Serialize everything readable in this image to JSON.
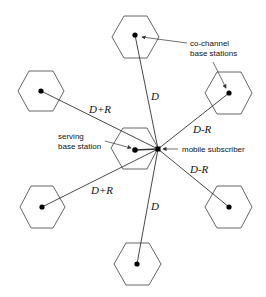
{
  "diagram": {
    "labels": {
      "co_channel_line1": "co-channel",
      "co_channel_line2": "base stations",
      "serving_line1": "serving",
      "serving_line2": "base station",
      "mobile": "mobile  subscriber"
    },
    "distances": {
      "top": "D",
      "upper_left": "D+R",
      "upper_right": "D-R",
      "lower_right": "D-R",
      "lower_left": "D+R",
      "bottom": "D"
    },
    "cells": [
      {
        "id": "top",
        "role": "co-channel base station"
      },
      {
        "id": "upper-left",
        "role": "co-channel base station"
      },
      {
        "id": "upper-right",
        "role": "co-channel base station"
      },
      {
        "id": "lower-left",
        "role": "co-channel base station"
      },
      {
        "id": "lower-right",
        "role": "co-channel base station"
      },
      {
        "id": "bottom",
        "role": "co-channel base station"
      },
      {
        "id": "serving",
        "role": "serving base station"
      }
    ],
    "colors": {
      "stroke": "#555555",
      "dot": "#000000",
      "text": "#111111"
    }
  }
}
